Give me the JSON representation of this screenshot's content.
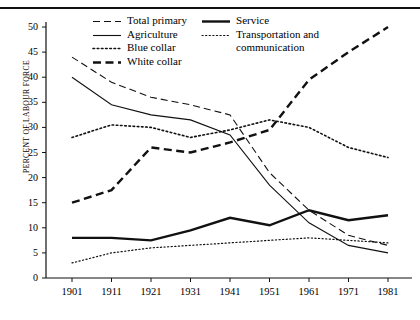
{
  "chart_data": {
    "type": "line",
    "title": "",
    "xlabel": "",
    "ylabel": "PERCENT OF LABOUR FORCE",
    "x": [
      1901,
      1911,
      1921,
      1931,
      1941,
      1951,
      1961,
      1971,
      1981
    ],
    "xticklabels": [
      "1901",
      "1911",
      "1921",
      "1931",
      "1941",
      "1951",
      "1961",
      "1971",
      "1981"
    ],
    "yticklabels": [
      "0",
      "5",
      "10",
      "15",
      "20",
      "25",
      "30",
      "35",
      "40",
      "45",
      "50"
    ],
    "yticks": [
      0,
      5,
      10,
      15,
      20,
      25,
      30,
      35,
      40,
      45,
      50
    ],
    "ylim": [
      0,
      51
    ],
    "xlim": [
      1897,
      1985
    ],
    "grid": false,
    "legend_position": "top-center",
    "series": [
      {
        "name": "Total primary",
        "style": "dashed",
        "values": [
          44.0,
          39.0,
          36.0,
          34.5,
          32.5,
          21.0,
          13.5,
          8.5,
          6.5
        ]
      },
      {
        "name": "Agriculture",
        "style": "solid-thin",
        "values": [
          40.0,
          34.5,
          32.5,
          31.5,
          28.5,
          18.5,
          11.0,
          6.5,
          5.0
        ]
      },
      {
        "name": "Blue collar",
        "style": "dotted",
        "values": [
          28.0,
          30.5,
          30.0,
          28.0,
          29.5,
          31.5,
          30.0,
          26.0,
          24.0
        ]
      },
      {
        "name": "White collar",
        "style": "dashed-bold",
        "values": [
          15.0,
          17.5,
          26.0,
          25.0,
          27.0,
          29.5,
          39.5,
          45.0,
          50.0
        ]
      },
      {
        "name": "Service",
        "style": "solid-bold",
        "values": [
          8.0,
          8.0,
          7.5,
          9.5,
          12.0,
          10.5,
          13.5,
          11.5,
          12.5
        ]
      },
      {
        "name": "Transportation and communication",
        "style": "dotted-fine",
        "values": [
          3.0,
          5.0,
          6.0,
          6.5,
          7.0,
          7.5,
          8.0,
          7.5,
          7.0
        ]
      }
    ],
    "legend": [
      {
        "label": "Total primary",
        "style": "dashed"
      },
      {
        "label": "Service",
        "style": "solid-bold"
      },
      {
        "label": "Agriculture",
        "style": "solid-thin"
      },
      {
        "label": "Transportation and",
        "label2": "communication",
        "style": "dotted-fine"
      },
      {
        "label": "Blue collar",
        "style": "dotted"
      },
      {
        "label": "White collar",
        "style": "dashed-bold"
      }
    ]
  }
}
